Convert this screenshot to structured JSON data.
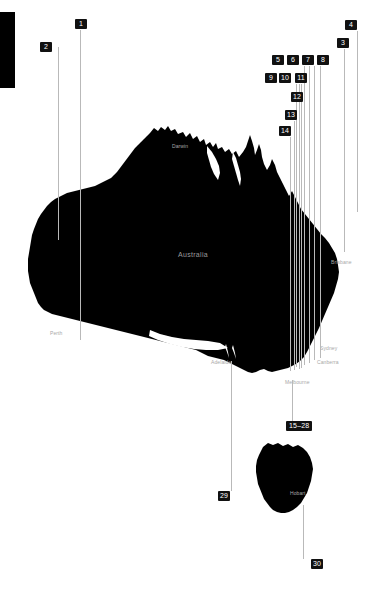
{
  "figure": {
    "background_color": "#ffffff",
    "landmass_color": "#000000",
    "leader_line_color": "#b9b9b9",
    "tag_background_color": "#111111",
    "tag_text_color": "#ffffff",
    "label_text_color": "#a8a8a8"
  },
  "country_label": {
    "text": "Australia",
    "x": 178,
    "y": 251
  },
  "city_labels": [
    {
      "name": "Darwin",
      "text": "Darwin",
      "x": 172,
      "y": 143
    },
    {
      "name": "Brisbane",
      "text": "Brisbane",
      "x": 331,
      "y": 259
    },
    {
      "name": "Perth",
      "text": "Perth",
      "x": 50,
      "y": 330
    },
    {
      "name": "Sydney",
      "text": "Sydney",
      "x": 320,
      "y": 345
    },
    {
      "name": "Canberra",
      "text": "Canberra",
      "x": 317,
      "y": 359
    },
    {
      "name": "Adelaide",
      "text": "Adelaide",
      "x": 211,
      "y": 359
    },
    {
      "name": "Melbourne",
      "text": "Melbourne",
      "x": 285,
      "y": 379
    },
    {
      "name": "Hobart",
      "text": "Hobart",
      "x": 290,
      "y": 490
    }
  ],
  "callouts": [
    {
      "id": "1",
      "label": "1",
      "tag_x": 75,
      "tag_y": 19,
      "line_x": 80,
      "line_top": 30,
      "line_bottom": 340
    },
    {
      "id": "2",
      "label": "2",
      "tag_x": 40,
      "tag_y": 42,
      "line_x": 58,
      "line_top": 47,
      "line_bottom": 240
    },
    {
      "id": "3",
      "label": "3",
      "tag_x": 337,
      "tag_y": 38,
      "line_x": 344,
      "line_top": 49,
      "line_bottom": 252
    },
    {
      "id": "4",
      "label": "4",
      "tag_x": 345,
      "tag_y": 20,
      "line_x": 357,
      "line_top": 31,
      "line_bottom": 212
    },
    {
      "id": "5",
      "label": "5",
      "tag_x": 272,
      "tag_y": 55,
      "line_x": 320,
      "line_top": 66,
      "line_bottom": 358
    },
    {
      "id": "6",
      "label": "6",
      "tag_x": 287,
      "tag_y": 55,
      "line_x": 314,
      "line_top": 66,
      "line_bottom": 360
    },
    {
      "id": "7",
      "label": "7",
      "tag_x": 302,
      "tag_y": 55,
      "line_x": 309,
      "line_top": 66,
      "line_bottom": 363
    },
    {
      "id": "8",
      "label": "8",
      "tag_x": 317,
      "tag_y": 55,
      "line_x": 304,
      "line_top": 66,
      "line_bottom": 365
    },
    {
      "id": "9",
      "label": "9",
      "tag_x": 265,
      "tag_y": 73,
      "line_x": 299,
      "line_top": 84,
      "line_bottom": 366
    },
    {
      "id": "10",
      "label": "10",
      "tag_x": 279,
      "tag_y": 73,
      "line_x": 296,
      "line_top": 84,
      "line_bottom": 367
    },
    {
      "id": "11",
      "label": "11",
      "tag_x": 295,
      "tag_y": 73,
      "line_x": 301,
      "line_top": 84,
      "line_bottom": 368
    },
    {
      "id": "12",
      "label": "12",
      "tag_x": 291,
      "tag_y": 92,
      "line_x": 299,
      "line_top": 103,
      "line_bottom": 369
    },
    {
      "id": "13",
      "label": "13",
      "tag_x": 285,
      "tag_y": 110,
      "line_x": 294,
      "line_top": 121,
      "line_bottom": 370
    },
    {
      "id": "14",
      "label": "14",
      "tag_x": 279,
      "tag_y": 126,
      "line_x": 290,
      "line_top": 137,
      "line_bottom": 371
    },
    {
      "id": "15-28",
      "label": "15–28",
      "tag_x": 286,
      "tag_y": 421,
      "line_x": 292,
      "line_top": 380,
      "line_bottom": 421
    },
    {
      "id": "29",
      "label": "29",
      "tag_x": 218,
      "tag_y": 491,
      "line_x": 231,
      "line_top": 361,
      "line_bottom": 491
    },
    {
      "id": "30",
      "label": "30",
      "tag_x": 311,
      "tag_y": 559,
      "line_x": 303,
      "line_top": 505,
      "line_bottom": 559
    }
  ]
}
